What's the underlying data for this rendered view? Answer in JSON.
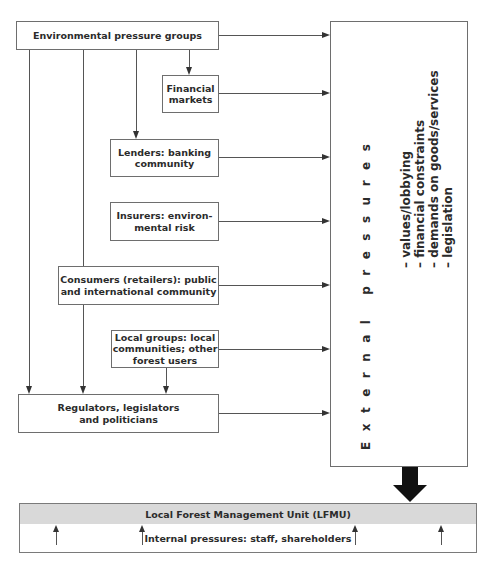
{
  "diagram": {
    "sources": {
      "environmental_groups": "Environmental pressure groups",
      "financial_markets_l1": "Financial",
      "financial_markets_l2": "markets",
      "lenders_l1": "Lenders: banking",
      "lenders_l2": "community",
      "insurers_l1": "Insurers: environ-",
      "insurers_l2": "mental risk",
      "consumers_l1": "Consumers (retailers): public",
      "consumers_l2": "and international community",
      "local_groups_l1": "Local groups: local",
      "local_groups_l2": "communities; other",
      "local_groups_l3": "forest users",
      "regulators_l1": "Regulators, legislators",
      "regulators_l2": "and politicians"
    },
    "external_pressures": {
      "title": "External pressures",
      "items": [
        "– values/lobbying",
        "– financial constraints",
        "– demands on goods/services",
        "– legislation"
      ]
    },
    "lfmu": {
      "title": "Local Forest Management Unit (LFMU)",
      "internal": "Internal pressures: staff, shareholders"
    }
  }
}
